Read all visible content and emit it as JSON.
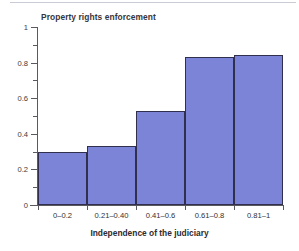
{
  "chart_data": {
    "type": "bar",
    "title": "Property rights enforcement",
    "xlabel": "Independence of the judiciary",
    "ylabel": "",
    "categories": [
      "0–0.2",
      "0.21–0.40",
      "0.41–0.6",
      "0.61–0.8",
      "0.81–1"
    ],
    "values": [
      0.3,
      0.33,
      0.53,
      0.83,
      0.84
    ],
    "ylim": [
      0,
      1
    ],
    "yticks": [
      0,
      0.2,
      0.4,
      0.6,
      0.8,
      1
    ],
    "ytick_labels": [
      "0",
      "0.2",
      "0.4",
      "0.6",
      "0.8",
      "1"
    ],
    "yminor_ticks": [
      0.1,
      0.3,
      0.5,
      0.7,
      0.9
    ],
    "grid": false,
    "legend": null,
    "bar_color": "#7b84d6",
    "bar_edge_color": "#30304e",
    "axis_color": "#59595f",
    "title_color": "#35353b",
    "background": "#ffffff"
  }
}
